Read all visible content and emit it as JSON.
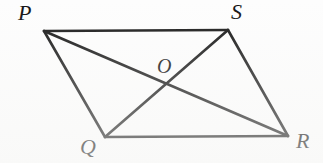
{
  "figure": {
    "kind": "geometry-diagram",
    "shape_name": "parallelogram",
    "width": 323,
    "height": 163,
    "background_color": "#fdfdfd",
    "stroke_color": "#151515",
    "stroke_width": 2.6,
    "labels": {
      "p": "P",
      "q": "Q",
      "r": "R",
      "s": "S",
      "o": "O"
    },
    "points": {
      "P": {
        "x": 44,
        "y": 31
      },
      "S": {
        "x": 228,
        "y": 30
      },
      "Q": {
        "x": 105,
        "y": 137
      },
      "R": {
        "x": 288,
        "y": 136
      },
      "O": {
        "x": 166,
        "y": 84
      }
    },
    "label_positions": {
      "P": {
        "x": 18,
        "y": 2
      },
      "S": {
        "x": 231,
        "y": 1
      },
      "Q": {
        "x": 80,
        "y": 136
      },
      "R": {
        "x": 296,
        "y": 130
      },
      "O": {
        "x": 157,
        "y": 56
      }
    },
    "segments": [
      {
        "name": "side-PS",
        "from": "P",
        "to": "S",
        "type": "side"
      },
      {
        "name": "side-SR",
        "from": "S",
        "to": "R",
        "type": "side"
      },
      {
        "name": "side-RQ",
        "from": "R",
        "to": "Q",
        "type": "side"
      },
      {
        "name": "side-QP",
        "from": "Q",
        "to": "P",
        "type": "side"
      },
      {
        "name": "diagonal-PR",
        "from": "P",
        "to": "R",
        "type": "diagonal"
      },
      {
        "name": "diagonal-QS",
        "from": "Q",
        "to": "S",
        "type": "diagonal"
      }
    ]
  }
}
